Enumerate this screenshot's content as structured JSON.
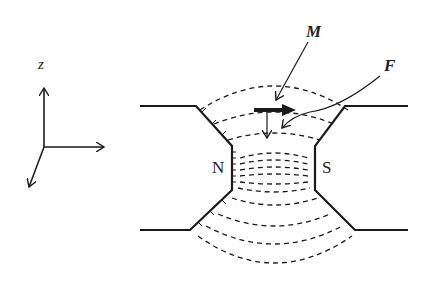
{
  "axes": {
    "z_label": "z"
  },
  "labels": {
    "north_pole": "N",
    "south_pole": "S",
    "magnetization": "M",
    "force": "F"
  },
  "colors": {
    "line": "#1a1a1a",
    "background": "#ffffff"
  }
}
